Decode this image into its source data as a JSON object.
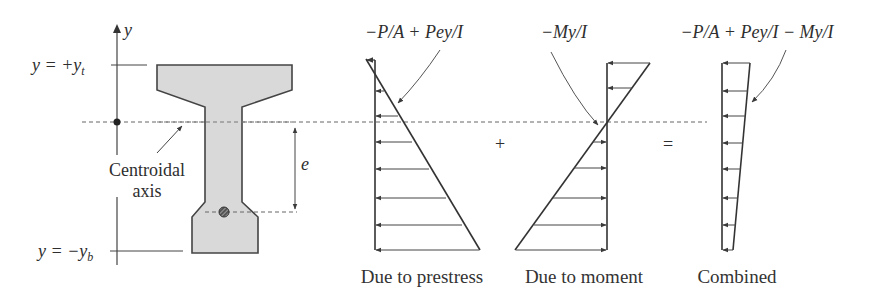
{
  "figure": {
    "section": {
      "axis_label": "y",
      "top_label": "y = +y",
      "top_label_sub": "t",
      "bottom_label": "y = −y",
      "bottom_label_sub": "b",
      "centroid_label_line1": "Centroidal",
      "centroid_label_line2": "axis",
      "eccentricity_label": "e",
      "fill_color": "#d9d9d9",
      "stroke_color": "#444444"
    },
    "diagrams": [
      {
        "id": "prestress",
        "formula": "−P/A + Pey/I",
        "caption": "Due to prestress"
      },
      {
        "id": "moment",
        "formula": "−My/I",
        "caption": "Due to moment"
      },
      {
        "id": "combined",
        "formula": "−P/A + Pey/I − My/I",
        "caption": "Combined"
      }
    ],
    "operators": {
      "plus": "+",
      "equals": "="
    }
  }
}
